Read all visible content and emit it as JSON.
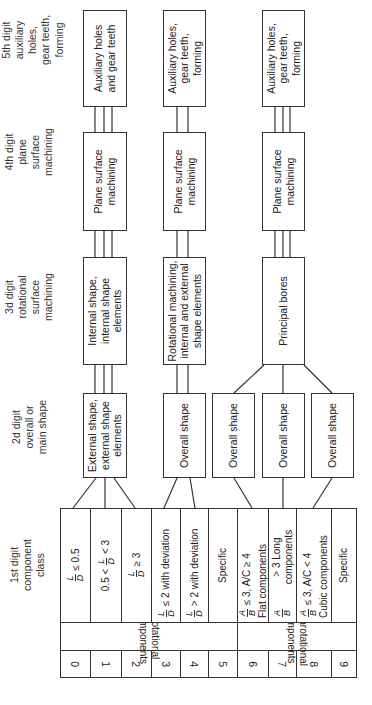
{
  "headers": {
    "d1": "1st digit\ncomponent\nclass",
    "d2": "2d digit\noverall or\nmain shape",
    "d3": "3d digit\nrotational\nsurface\nmachining",
    "d4": "4th digit\nplane\nsurface\nmachining",
    "d5": "5th digit\nauxiliary\nholes,\ngear teeth,\nforming"
  },
  "chains": [
    {
      "d2": "External shape,\nexternal shape\nelements",
      "d3": "Internal shape,\ninternal shape\nelements",
      "d4": "Plane surface\nmachining",
      "d5": "Auxiliary holes\nand gear teeth"
    },
    {
      "d2": "Overall shape",
      "d3": "Rotational machining,\ninternal and external\nshape elements",
      "d4": "Plane surface\nmachining",
      "d5": "Auxiliary holes,\ngear teeth,\nforming"
    },
    {
      "d2a": "Overall shape",
      "d2b": "Overall shape",
      "d2c": "Overall shape",
      "d3": "Principal bores",
      "d4": "Plane surface\nmachining",
      "d5": "Auxiliary holes,\ngear teeth,\nforming"
    }
  ],
  "table": {
    "groups": [
      {
        "label": "Rotational components"
      },
      {
        "label": "Nonrotational\ncomponents"
      }
    ],
    "classes": [
      {
        "digit": "0",
        "pre": "",
        "num": "L",
        "den": "D",
        "post": "≤ 0.5",
        "sub": ""
      },
      {
        "digit": "1",
        "pre": "0.5 <",
        "num": "L",
        "den": "D",
        "post": "< 3",
        "sub": ""
      },
      {
        "digit": "2",
        "pre": "",
        "num": "L",
        "den": "D",
        "post": "≥ 3",
        "sub": ""
      },
      {
        "digit": "3",
        "pre": "",
        "num": "L",
        "den": "D",
        "post": "≤ 2 with deviation",
        "sub": ""
      },
      {
        "digit": "4",
        "pre": "",
        "num": "L",
        "den": "D",
        "post": "> 2 with deviation",
        "sub": ""
      },
      {
        "digit": "5",
        "pre": "",
        "num": "",
        "den": "",
        "post": "Specific",
        "sub": ""
      },
      {
        "digit": "6",
        "pre": "",
        "num": "A",
        "den": "B",
        "post": "≤ 3, A/C ≥ 4",
        "sub": "Flat components"
      },
      {
        "digit": "7",
        "pre": "",
        "num": "A",
        "den": "B",
        "post": "> 3 Long components",
        "sub": ""
      },
      {
        "digit": "8",
        "pre": "",
        "num": "A",
        "den": "B",
        "post": "≤ 3, A/C < 4",
        "sub": "Cubic components"
      },
      {
        "digit": "9",
        "pre": "",
        "num": "",
        "den": "",
        "post": "Specific",
        "sub": ""
      }
    ]
  }
}
